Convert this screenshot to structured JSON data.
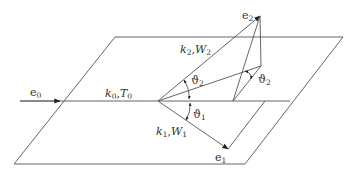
{
  "diagram": {
    "type": "3d-vector-geometry",
    "labels": {
      "e0": {
        "base": "e",
        "sub": "0"
      },
      "e1": {
        "base": "e",
        "sub": "1"
      },
      "e2": {
        "base": "e",
        "sub": "2"
      },
      "k0T0": {
        "k": "k",
        "ksub": "0",
        "sep": ",",
        "T": "T",
        "Tsub": "0"
      },
      "k1W1": {
        "k": "k",
        "ksub": "1",
        "sep": ",",
        "W": "W",
        "Wsub": "1"
      },
      "k2W2": {
        "k": "k",
        "ksub": "2",
        "sep": ",",
        "W": "W",
        "Wsub": "2"
      },
      "theta1": {
        "base": "ϑ",
        "sub": "1"
      },
      "theta2": {
        "base": "ϑ",
        "sub": "2"
      },
      "phi2": {
        "base": "ϑ",
        "sub": "2"
      }
    },
    "colors": {
      "line": "#555555",
      "text": "#333333",
      "arrow": "#222222"
    }
  }
}
